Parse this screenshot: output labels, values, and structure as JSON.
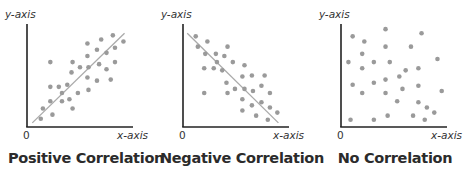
{
  "colors": {
    "axis": "#222222",
    "dot": "#9a9a9a",
    "trend_line": "#aaaaaa",
    "text": "#2b2b2b"
  },
  "chart_data": [
    {
      "type": "scatter",
      "title": "Positive Correlation",
      "xlabel": "x-axis",
      "ylabel": "y-axis",
      "origin_label": "0",
      "xlim": [
        0,
        100
      ],
      "ylim": [
        0,
        100
      ],
      "grid": false,
      "points": [
        [
          13,
          8
        ],
        [
          24,
          12
        ],
        [
          15,
          18
        ],
        [
          22,
          25
        ],
        [
          43,
          18
        ],
        [
          33,
          25
        ],
        [
          40,
          27
        ],
        [
          33,
          33
        ],
        [
          22,
          39
        ],
        [
          30,
          39
        ],
        [
          38,
          41
        ],
        [
          48,
          33
        ],
        [
          58,
          36
        ],
        [
          57,
          48
        ],
        [
          66,
          45
        ],
        [
          79,
          46
        ],
        [
          42,
          53
        ],
        [
          50,
          58
        ],
        [
          58,
          58
        ],
        [
          68,
          61
        ],
        [
          75,
          56
        ],
        [
          83,
          63
        ],
        [
          22,
          63
        ],
        [
          43,
          63
        ],
        [
          57,
          69
        ],
        [
          66,
          75
        ],
        [
          75,
          72
        ],
        [
          83,
          77
        ],
        [
          91,
          83
        ],
        [
          57,
          81
        ],
        [
          70,
          85
        ],
        [
          81,
          89
        ]
      ],
      "trend_line": [
        [
          5,
          4
        ],
        [
          92,
          91
        ]
      ]
    },
    {
      "type": "scatter",
      "title": "Negative Correlation",
      "xlabel": "x-axis",
      "ylabel": "y-axis",
      "origin_label": "0",
      "xlim": [
        0,
        100
      ],
      "ylim": [
        0,
        100
      ],
      "grid": false,
      "points": [
        [
          12,
          88
        ],
        [
          23,
          83
        ],
        [
          14,
          78
        ],
        [
          42,
          78
        ],
        [
          21,
          71
        ],
        [
          31,
          71
        ],
        [
          39,
          69
        ],
        [
          32,
          63
        ],
        [
          47,
          63
        ],
        [
          58,
          60
        ],
        [
          20,
          57
        ],
        [
          29,
          57
        ],
        [
          37,
          55
        ],
        [
          65,
          50
        ],
        [
          77,
          50
        ],
        [
          56,
          49
        ],
        [
          41,
          43
        ],
        [
          74,
          40
        ],
        [
          49,
          37
        ],
        [
          58,
          37
        ],
        [
          66,
          35
        ],
        [
          20,
          33
        ],
        [
          42,
          33
        ],
        [
          82,
          33
        ],
        [
          56,
          27
        ],
        [
          74,
          24
        ],
        [
          65,
          21
        ],
        [
          82,
          19
        ],
        [
          56,
          16
        ],
        [
          89,
          14
        ],
        [
          69,
          11
        ],
        [
          80,
          7
        ]
      ],
      "trend_line": [
        [
          4,
          91
        ],
        [
          90,
          4
        ]
      ]
    },
    {
      "type": "scatter",
      "title": "No Correlation",
      "xlabel": "x-axis",
      "ylabel": "y-axis",
      "origin_label": "0",
      "xlim": [
        0,
        100
      ],
      "ylim": [
        0,
        100
      ],
      "grid": false,
      "points": [
        [
          11,
          88
        ],
        [
          22,
          83
        ],
        [
          42,
          95
        ],
        [
          76,
          91
        ],
        [
          42,
          78
        ],
        [
          66,
          78
        ],
        [
          20,
          71
        ],
        [
          7,
          63
        ],
        [
          31,
          63
        ],
        [
          46,
          63
        ],
        [
          91,
          66
        ],
        [
          20,
          57
        ],
        [
          61,
          55
        ],
        [
          73,
          57
        ],
        [
          55,
          49
        ],
        [
          42,
          46
        ],
        [
          31,
          43
        ],
        [
          11,
          41
        ],
        [
          73,
          40
        ],
        [
          58,
          37
        ],
        [
          20,
          33
        ],
        [
          42,
          33
        ],
        [
          95,
          35
        ],
        [
          53,
          25
        ],
        [
          73,
          24
        ],
        [
          81,
          19
        ],
        [
          88,
          14
        ],
        [
          44,
          11
        ],
        [
          68,
          11
        ],
        [
          9,
          7
        ],
        [
          31,
          7
        ],
        [
          79,
          7
        ]
      ],
      "trend_line": null
    }
  ]
}
